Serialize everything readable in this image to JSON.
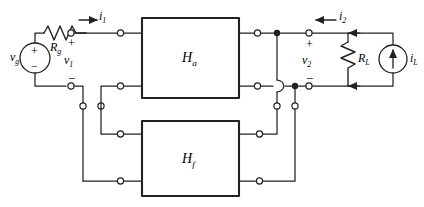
{
  "figure": {
    "kind": "circuit-schematic",
    "stroke_color": "#222222",
    "fill_color": "#ffffff",
    "background": "#ffffff"
  },
  "blocks": [
    {
      "id": "Ha",
      "label_main": "H",
      "label_sub": "a",
      "x": 142,
      "y": 18,
      "w": 97,
      "h": 80
    },
    {
      "id": "Hf",
      "label_main": "H",
      "label_sub": "f",
      "x": 142,
      "y": 121,
      "w": 97,
      "h": 75
    }
  ],
  "sources": [
    {
      "id": "vg",
      "type": "voltage-source",
      "label_main": "v",
      "label_sub": "g",
      "plus": "+",
      "minus": "−"
    },
    {
      "id": "iL",
      "type": "current-source",
      "label_main": "i",
      "label_sub": "L"
    }
  ],
  "resistors": [
    {
      "id": "Rg",
      "label_main": "R",
      "label_sub": "g",
      "orientation": "horizontal"
    },
    {
      "id": "RL",
      "label_main": "R",
      "label_sub": "L",
      "orientation": "vertical"
    }
  ],
  "port_labels": [
    {
      "id": "v1",
      "label_main": "v",
      "label_sub": "1",
      "polarity_plus": "+",
      "polarity_minus": "−"
    },
    {
      "id": "v2",
      "label_main": "v",
      "label_sub": "2",
      "polarity_plus": "+",
      "polarity_minus": "−"
    }
  ],
  "currents": [
    {
      "id": "i1",
      "label_main": "i",
      "label_sub": "1",
      "direction": "right"
    },
    {
      "id": "i2",
      "label_main": "i",
      "label_sub": "2",
      "direction": "left"
    },
    {
      "id": "iL",
      "label_main": "i",
      "label_sub": "L",
      "direction": "up"
    }
  ],
  "annotations": {
    "plus1": "+",
    "minus1": "−",
    "plus2": "+",
    "minus2": "−"
  }
}
